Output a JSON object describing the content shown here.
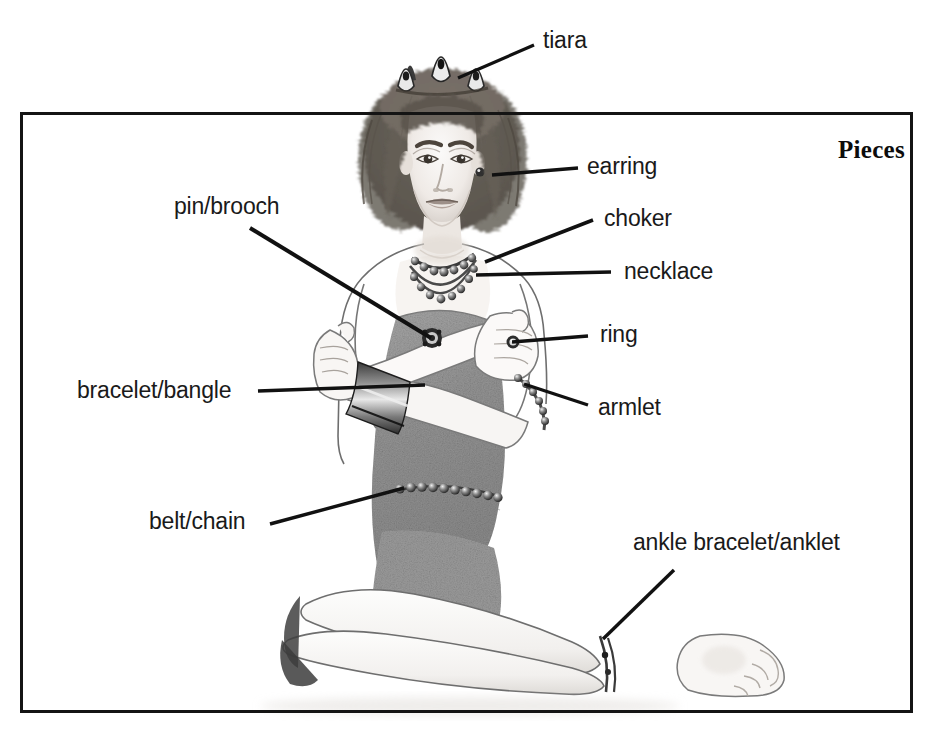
{
  "figure": {
    "title": "Pieces"
  },
  "labels": [
    {
      "id": "tiara",
      "text": "tiara",
      "x": 543,
      "y": 29,
      "anchor": "left"
    },
    {
      "id": "earring",
      "text": "earring",
      "x": 587,
      "y": 155,
      "anchor": "left"
    },
    {
      "id": "pin-brooch",
      "text": "pin/brooch",
      "x": 174,
      "y": 195,
      "anchor": "left"
    },
    {
      "id": "choker",
      "text": "choker",
      "x": 604,
      "y": 207,
      "anchor": "left"
    },
    {
      "id": "necklace",
      "text": "necklace",
      "x": 624,
      "y": 260,
      "anchor": "left"
    },
    {
      "id": "ring",
      "text": "ring",
      "x": 600,
      "y": 323,
      "anchor": "left"
    },
    {
      "id": "bracelet-bangle",
      "text": "bracelet/bangle",
      "x": 77,
      "y": 379,
      "anchor": "left"
    },
    {
      "id": "armlet",
      "text": "armlet",
      "x": 598,
      "y": 396,
      "anchor": "left"
    },
    {
      "id": "belt-chain",
      "text": "belt/chain",
      "x": 149,
      "y": 510,
      "anchor": "left"
    },
    {
      "id": "ankle-anklet",
      "text": "ankle bracelet/anklet",
      "x": 633,
      "y": 531,
      "anchor": "left"
    }
  ],
  "leader_lines": [
    {
      "id": "tiara-line",
      "x1": 534,
      "y1": 45,
      "x2": 458,
      "y2": 78,
      "width": 3.2
    },
    {
      "id": "earring-line",
      "x1": 578,
      "y1": 168,
      "x2": 492,
      "y2": 175,
      "width": 3.6
    },
    {
      "id": "pin-brooch-line",
      "x1": 250,
      "y1": 228,
      "x2": 431,
      "y2": 338,
      "width": 4.0
    },
    {
      "id": "choker-line",
      "x1": 593,
      "y1": 220,
      "x2": 485,
      "y2": 262,
      "width": 3.6
    },
    {
      "id": "necklace-line",
      "x1": 611,
      "y1": 272,
      "x2": 476,
      "y2": 275,
      "width": 3.6
    },
    {
      "id": "ring-line",
      "x1": 588,
      "y1": 336,
      "x2": 512,
      "y2": 342,
      "width": 3.4
    },
    {
      "id": "bracelet-bangle-line",
      "x1": 258,
      "y1": 391,
      "x2": 425,
      "y2": 385,
      "width": 3.4
    },
    {
      "id": "armlet-line",
      "x1": 588,
      "y1": 405,
      "x2": 524,
      "y2": 384,
      "width": 3.4
    },
    {
      "id": "belt-chain-line",
      "x1": 270,
      "y1": 524,
      "x2": 404,
      "y2": 488,
      "width": 3.4
    },
    {
      "id": "ankle-anklet-line",
      "x1": 674,
      "y1": 570,
      "x2": 603,
      "y2": 639,
      "width": 3.4
    }
  ],
  "colors": {
    "frame": "#141414",
    "leader": "#111111",
    "text": "#1a1a1a",
    "dress": "#9a9a9a",
    "skin": "#f6f4f2",
    "hair": "#6e6a66",
    "background": "#ffffff"
  }
}
